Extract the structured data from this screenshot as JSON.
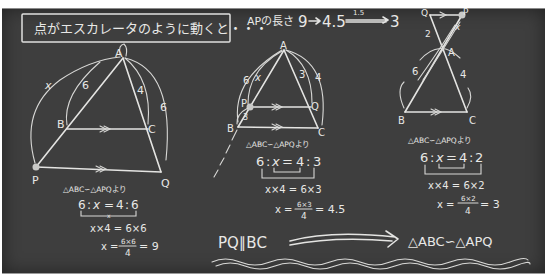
{
  "title": "点がエスカレータのように動くと・・・",
  "ap_length_note": {
    "label": "APの長さ",
    "v1": "9",
    "v2": "4.5",
    "v3": "3",
    "arrow1_label": "",
    "arrow2_label": "1.5"
  },
  "diagram1": {
    "vertices": {
      "A": "A",
      "B": "B",
      "C": "C",
      "P": "P",
      "Q": "Q"
    },
    "labels": {
      "AP": "x",
      "AB": "6",
      "AC": "4",
      "AQ": "6"
    },
    "similarity": "△ABC∽△APQより",
    "ratio": {
      "a": "6",
      "b": "x",
      "c": "4",
      "d": "6",
      "sep": ":",
      "eq": "="
    },
    "bracket_mark": "x",
    "eq1": "x×4 = 6×6",
    "eq2_lhs": "x =",
    "eq2_num": "6×6",
    "eq2_den": "4",
    "eq2_rhs": "= 9"
  },
  "diagram2": {
    "vertices": {
      "A": "A",
      "B": "B",
      "C": "C",
      "P": "P",
      "Q": "Q"
    },
    "labels": {
      "AP": "x",
      "AB": "6",
      "AQ": "3",
      "AC": "4",
      "PB": "3"
    },
    "similarity": "△ABC∽△APQより",
    "ratio": {
      "a": "6",
      "b": "x",
      "c": "4",
      "d": "3",
      "sep": ":",
      "eq": "="
    },
    "eq1": "x×4 = 6×3",
    "eq2_lhs": "x =",
    "eq2_num": "6×3",
    "eq2_den": "4",
    "eq2_rhs": "= 4.5"
  },
  "diagram3": {
    "vertices": {
      "A": "A",
      "B": "B",
      "C": "C",
      "P": "P",
      "Q": "Q"
    },
    "labels": {
      "AQ": "2",
      "AB": "6",
      "AC": "4",
      "AP": "x"
    },
    "similarity": "△ABC∽△APQより",
    "ratio": {
      "a": "6",
      "b": "x",
      "c": "4",
      "d": "2",
      "sep": ":",
      "eq": "="
    },
    "eq1": "x×4 = 6×2",
    "eq2_lhs": "x =",
    "eq2_num": "6×2",
    "eq2_den": "4",
    "eq2_rhs": "= 3"
  },
  "conclusion": {
    "premise": "PQ∥BC",
    "result": "△ABC∽△APQ"
  },
  "colors": {
    "board": "#3e3e3e",
    "chalk": "#e8e8e6"
  }
}
